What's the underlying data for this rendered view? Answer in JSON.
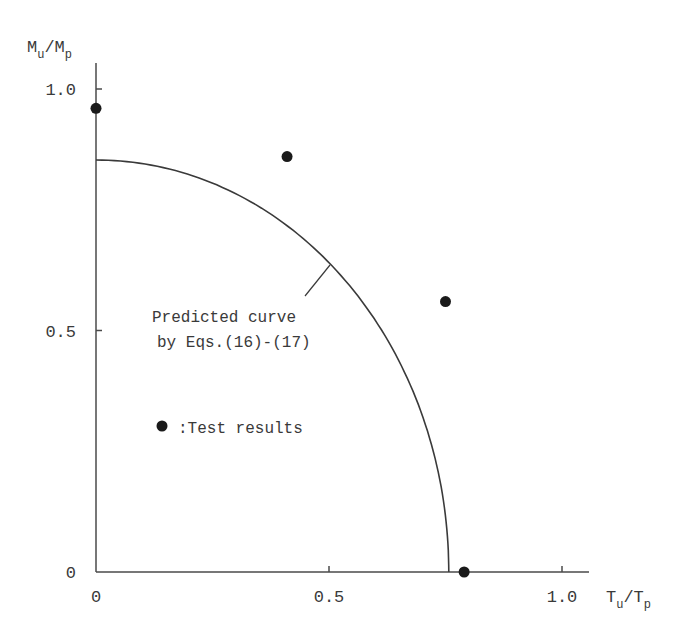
{
  "chart_data": {
    "type": "scatter",
    "title": "",
    "xlabel": "T_u/T_p",
    "ylabel": "M_u/M_p",
    "xlabel_main": "T",
    "xlabel_sub1": "u",
    "xlabel_sep": "/T",
    "xlabel_sub2": "p",
    "ylabel_main": "M",
    "ylabel_sub1": "u",
    "ylabel_sep": "/M",
    "ylabel_sub2": "p",
    "xlim": [
      0,
      1.1
    ],
    "ylim": [
      0,
      1.05
    ],
    "grid": false,
    "x_ticks": [
      {
        "value": 0,
        "label": "0"
      },
      {
        "value": 0.5,
        "label": "0.5"
      },
      {
        "value": 1.0,
        "label": "1.0"
      }
    ],
    "y_ticks": [
      {
        "value": 0,
        "label": "0"
      },
      {
        "value": 0.5,
        "label": "0.5"
      },
      {
        "value": 1.0,
        "label": "1.0"
      }
    ],
    "series": [
      {
        "name": "Test results",
        "kind": "scatter",
        "marker": "filled-circle",
        "points": [
          {
            "x": 0.0,
            "y": 0.96
          },
          {
            "x": 0.41,
            "y": 0.86
          },
          {
            "x": 0.75,
            "y": 0.56
          },
          {
            "x": 0.79,
            "y": 0.0
          }
        ]
      },
      {
        "name": "Predicted curve by Eqs.(16)-(17)",
        "kind": "line",
        "shape": "quarter-ellipse",
        "x_intercept": 0.757,
        "y_intercept": 0.853
      }
    ],
    "annotations": [
      {
        "text_line1": "Predicted curve",
        "text_line2": "by Eqs.(16)-(17)",
        "points_to": {
          "x": 0.5,
          "y": 0.64
        }
      },
      {
        "legend_symbol": "●",
        "text": ":Test results"
      }
    ],
    "legend_position": "inside-left"
  }
}
